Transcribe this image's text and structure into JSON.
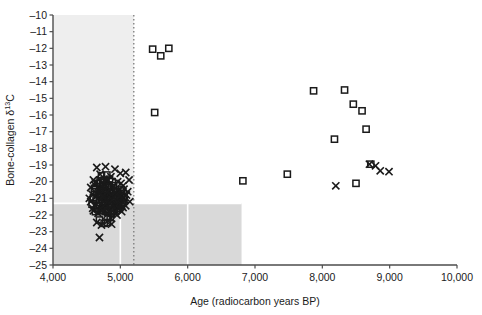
{
  "chart_data": {
    "type": "scatter",
    "title": "",
    "xlabel": "Age (radiocarbon years BP)",
    "ylabel": "Bone-collagen δ¹³C",
    "ylabel_parts": {
      "main": "Bone-collagen δ",
      "sup": "13",
      "tail": "C"
    },
    "xlim": [
      4000,
      10000
    ],
    "ylim": [
      -25,
      -10
    ],
    "xticks": [
      4000,
      5000,
      6000,
      7000,
      8000,
      9000,
      10000
    ],
    "xtick_labels": [
      "4,000",
      "5,000",
      "6,000",
      "7,000",
      "8,000",
      "9,000",
      "10,000"
    ],
    "yticks": [
      -10,
      -11,
      -12,
      -13,
      -14,
      -15,
      -16,
      -17,
      -18,
      -19,
      -20,
      -21,
      -22,
      -23,
      -24,
      -25
    ],
    "ytick_labels": [
      "–10",
      "–11",
      "–12",
      "–13",
      "–14",
      "–15",
      "–16",
      "–17",
      "–18",
      "–19",
      "–20",
      "–21",
      "–22",
      "–23",
      "–24",
      "–25"
    ],
    "grid": "white gridlines at x=5,000 and x=6,000 and y=-21 over shaded panel",
    "legend": "none",
    "annotations": [
      {
        "name": "vertical-dotted-line",
        "x": 5200,
        "style": "dotted",
        "color": "#7a7a7a"
      }
    ],
    "shaded_regions": [
      {
        "name": "upper-left-panel",
        "x": [
          4000,
          5200
        ],
        "y": [
          -10,
          -25
        ],
        "color": "#eeeeee"
      },
      {
        "name": "lower-left-panel",
        "x": [
          4000,
          6800
        ],
        "y": [
          -21.3,
          -25
        ],
        "color": "#d9d9d9"
      }
    ],
    "colors": {
      "axis": "#4d4d4d",
      "marker": "#1a1a1a",
      "shade_light": "#eeeeee",
      "shade_dark": "#d9d9d9",
      "gridline": "#ffffff",
      "dotted_line": "#7a7a7a"
    },
    "series": [
      {
        "name": "squares",
        "marker": "square",
        "points": [
          [
            5480,
            -12.05
          ],
          [
            5600,
            -12.45
          ],
          [
            5720,
            -12.0
          ],
          [
            5510,
            -15.85
          ],
          [
            6820,
            -19.95
          ],
          [
            7480,
            -19.55
          ],
          [
            7870,
            -14.55
          ],
          [
            8180,
            -17.45
          ],
          [
            8330,
            -14.5
          ],
          [
            8460,
            -15.35
          ],
          [
            8590,
            -15.75
          ],
          [
            8650,
            -16.85
          ],
          [
            8720,
            -18.95
          ],
          [
            8500,
            -20.1
          ],
          [
            4720,
            -19.65
          ],
          [
            4760,
            -19.9
          ],
          [
            4800,
            -19.6
          ],
          [
            4840,
            -19.85
          ],
          [
            4660,
            -20.1
          ],
          [
            4700,
            -20.3
          ],
          [
            4740,
            -20.05
          ],
          [
            4780,
            -20.35
          ],
          [
            4820,
            -20.2
          ],
          [
            4860,
            -20.45
          ],
          [
            4900,
            -20.25
          ],
          [
            4930,
            -20.5
          ],
          [
            4620,
            -20.6
          ],
          [
            4670,
            -20.75
          ],
          [
            4710,
            -20.55
          ],
          [
            4750,
            -20.8
          ],
          [
            4790,
            -20.65
          ],
          [
            4830,
            -20.9
          ],
          [
            4870,
            -20.7
          ],
          [
            4910,
            -20.95
          ],
          [
            4950,
            -20.8
          ],
          [
            4990,
            -21.0
          ],
          [
            4640,
            -21.1
          ],
          [
            4690,
            -21.25
          ],
          [
            4730,
            -21.05
          ],
          [
            4770,
            -21.3
          ],
          [
            4810,
            -21.15
          ],
          [
            4850,
            -21.35
          ],
          [
            4890,
            -21.2
          ],
          [
            4930,
            -21.4
          ],
          [
            4970,
            -21.25
          ],
          [
            5010,
            -21.45
          ],
          [
            4660,
            -21.6
          ],
          [
            4700,
            -21.75
          ],
          [
            4740,
            -21.55
          ],
          [
            4780,
            -21.8
          ],
          [
            4820,
            -21.65
          ],
          [
            4870,
            -21.9
          ],
          [
            4910,
            -21.7
          ],
          [
            4950,
            -21.5
          ],
          [
            4690,
            -22.3
          ],
          [
            4760,
            -22.5
          ],
          [
            4810,
            -22.45
          ],
          [
            4850,
            -22.15
          ],
          [
            4600,
            -20.95
          ],
          [
            4630,
            -21.8
          ],
          [
            4880,
            -20.0
          ],
          [
            4960,
            -20.6
          ],
          [
            5020,
            -20.85
          ],
          [
            5050,
            -21.1
          ],
          [
            4580,
            -21.35
          ],
          [
            4700,
            -19.95
          ],
          [
            4755,
            -20.55
          ],
          [
            4795,
            -21.0
          ],
          [
            4835,
            -20.3
          ],
          [
            4875,
            -21.55
          ],
          [
            4915,
            -21.1
          ],
          [
            4955,
            -21.35
          ],
          [
            4995,
            -20.7
          ],
          [
            5035,
            -21.25
          ],
          [
            4615,
            -20.4
          ],
          [
            4655,
            -21.45
          ],
          [
            4695,
            -20.85
          ],
          [
            4735,
            -21.7
          ],
          [
            4775,
            -20.45
          ],
          [
            4815,
            -21.85
          ],
          [
            4855,
            -20.85
          ],
          [
            4895,
            -21.75
          ],
          [
            4935,
            -20.95
          ],
          [
            4975,
            -21.6
          ],
          [
            5015,
            -20.5
          ],
          [
            5055,
            -20.95
          ]
        ]
      },
      {
        "name": "crosses",
        "marker": "x",
        "points": [
          [
            8200,
            -20.25
          ],
          [
            8790,
            -19.05
          ],
          [
            8860,
            -19.35
          ],
          [
            8990,
            -19.4
          ],
          [
            8700,
            -18.95
          ],
          [
            4650,
            -19.15
          ],
          [
            4780,
            -19.1
          ],
          [
            4920,
            -19.25
          ],
          [
            5080,
            -19.45
          ],
          [
            5130,
            -19.9
          ],
          [
            4600,
            -19.9
          ],
          [
            4700,
            -19.55
          ],
          [
            4860,
            -19.7
          ],
          [
            5000,
            -19.5
          ],
          [
            4620,
            -20.2
          ],
          [
            4680,
            -20.45
          ],
          [
            4750,
            -20.15
          ],
          [
            4830,
            -20.5
          ],
          [
            4900,
            -20.3
          ],
          [
            4970,
            -20.55
          ],
          [
            5040,
            -20.25
          ],
          [
            5110,
            -20.6
          ],
          [
            4580,
            -20.75
          ],
          [
            4640,
            -20.9
          ],
          [
            4710,
            -20.7
          ],
          [
            4790,
            -21.0
          ],
          [
            4860,
            -20.8
          ],
          [
            4930,
            -21.05
          ],
          [
            5000,
            -20.85
          ],
          [
            5070,
            -21.1
          ],
          [
            4560,
            -21.2
          ],
          [
            4620,
            -21.4
          ],
          [
            4690,
            -21.2
          ],
          [
            4760,
            -21.45
          ],
          [
            4830,
            -21.25
          ],
          [
            4900,
            -21.5
          ],
          [
            4970,
            -21.3
          ],
          [
            5040,
            -21.55
          ],
          [
            4600,
            -21.75
          ],
          [
            4670,
            -21.9
          ],
          [
            4740,
            -21.7
          ],
          [
            4810,
            -21.95
          ],
          [
            4880,
            -21.75
          ],
          [
            4950,
            -22.0
          ],
          [
            5020,
            -21.8
          ],
          [
            4650,
            -22.45
          ],
          [
            4720,
            -22.6
          ],
          [
            4800,
            -22.4
          ],
          [
            4870,
            -22.55
          ],
          [
            4690,
            -23.35
          ],
          [
            5010,
            -20.1
          ],
          [
            5090,
            -20.8
          ],
          [
            5140,
            -21.2
          ],
          [
            4560,
            -20.35
          ],
          [
            4540,
            -21.0
          ],
          [
            4590,
            -21.6
          ],
          [
            4730,
            -20.05
          ],
          [
            4800,
            -19.85
          ],
          [
            4960,
            -20.0
          ],
          [
            5030,
            -21.0
          ],
          [
            4860,
            -22.2
          ],
          [
            4930,
            -20.6
          ],
          [
            5080,
            -21.45
          ],
          [
            4630,
            -20.05
          ],
          [
            4705,
            -21.6
          ],
          [
            4775,
            -21.35
          ],
          [
            4845,
            -21.6
          ],
          [
            4915,
            -21.85
          ],
          [
            4985,
            -21.6
          ],
          [
            5055,
            -20.45
          ],
          [
            4665,
            -20.6
          ],
          [
            4735,
            -20.9
          ],
          [
            4805,
            -20.6
          ],
          [
            4875,
            -21.1
          ],
          [
            4945,
            -20.75
          ],
          [
            5015,
            -21.35
          ]
        ]
      }
    ]
  }
}
